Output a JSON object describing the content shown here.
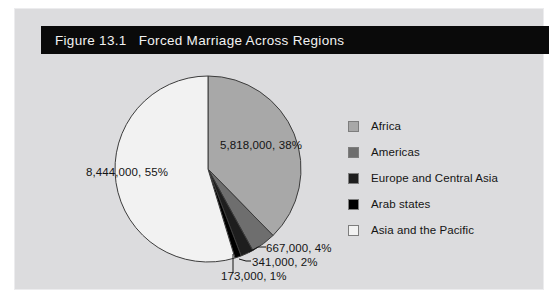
{
  "figure": {
    "title": "Figure 13.1   Forced Marriage Across Regions",
    "panel_background": "#dcdcde",
    "banner_background": "#0a0a0a",
    "banner_text_color": "#f2f2f2"
  },
  "legend": {
    "position": "right",
    "items": [
      {
        "label": "Africa",
        "color": "#a8a8a8"
      },
      {
        "label": "Americas",
        "color": "#6e6e6e"
      },
      {
        "label": "Europe and Central Asia",
        "color": "#1e1e1e"
      },
      {
        "label": "Arab states",
        "color": "#000000"
      },
      {
        "label": "Asia and the Pacific",
        "color": "#f2f2f2"
      }
    ]
  },
  "labels": {
    "africa": "5,818,000, 38%",
    "americas": "667,000, 4%",
    "europe": "341,000, 2%",
    "arab": "173,000, 1%",
    "asia": "8,444,000, 55%"
  },
  "chart_data": {
    "type": "pie",
    "title": "Figure 13.1   Forced Marriage Across Regions",
    "xlabel": "",
    "ylabel": "",
    "categories": [
      "Africa",
      "Americas",
      "Europe and Central Asia",
      "Arab states",
      "Asia and the Pacific"
    ],
    "values": [
      5818000,
      667000,
      341000,
      173000,
      8444000
    ],
    "percentages": [
      38,
      4,
      2,
      1,
      55
    ],
    "data_labels": [
      "5,818,000, 38%",
      "667,000, 4%",
      "341,000, 2%",
      "173,000, 1%",
      "8,444,000, 55%"
    ],
    "colors": [
      "#a8a8a8",
      "#6e6e6e",
      "#1e1e1e",
      "#000000",
      "#f2f2f2"
    ],
    "start_angle_deg": 0,
    "direction": "clockwise",
    "legend_position": "right",
    "grid": false,
    "units": "people in forced marriage"
  }
}
